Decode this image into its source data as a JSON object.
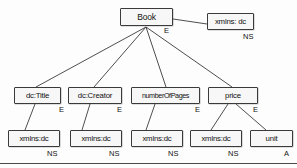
{
  "diagram": {
    "type": "node-tree",
    "stroke_color": "#3a3a3a",
    "node_fill": "#f7f7f7",
    "text_color": "#111111",
    "background": "#fdfdfd",
    "nodes": [
      {
        "id": "book",
        "label": "Book",
        "x": 120,
        "y": 8,
        "w": 53,
        "h": 18,
        "size": "normal"
      },
      {
        "id": "xmlns_top",
        "label": "xmlns: dc",
        "x": 207,
        "y": 13,
        "w": 47,
        "h": 17,
        "size": "small"
      },
      {
        "id": "dctitle",
        "label": "dc:Title",
        "x": 14,
        "y": 87,
        "w": 47,
        "h": 17,
        "size": "small"
      },
      {
        "id": "dccreator",
        "label": "dc:Creator",
        "x": 68,
        "y": 87,
        "w": 54,
        "h": 17,
        "size": "small"
      },
      {
        "id": "numpages",
        "label": "numberOfPages",
        "x": 131,
        "y": 87,
        "w": 69,
        "h": 17,
        "size": "tight"
      },
      {
        "id": "price",
        "label": "price",
        "x": 208,
        "y": 87,
        "w": 50,
        "h": 17,
        "size": "small"
      },
      {
        "id": "xmlns_1",
        "label": "xmlns:dc",
        "x": 8,
        "y": 130,
        "w": 52,
        "h": 17,
        "size": "small"
      },
      {
        "id": "xmlns_2",
        "label": "xmlns:dc",
        "x": 70,
        "y": 130,
        "w": 52,
        "h": 17,
        "size": "small"
      },
      {
        "id": "xmlns_3",
        "label": "xmlns:dc",
        "x": 131,
        "y": 130,
        "w": 52,
        "h": 17,
        "size": "small"
      },
      {
        "id": "xmlns_4",
        "label": "xmlns:dc",
        "x": 190,
        "y": 130,
        "w": 52,
        "h": 17,
        "size": "small"
      },
      {
        "id": "unit",
        "label": "unit",
        "x": 250,
        "y": 130,
        "w": 43,
        "h": 17,
        "size": "small"
      }
    ],
    "edges": [
      {
        "id": "book-xmlns",
        "x1": 173,
        "y1": 19,
        "x2": 207,
        "y2": 24
      },
      {
        "id": "book-dctitle",
        "x1": 146,
        "y1": 27,
        "x2": 36,
        "y2": 87
      },
      {
        "id": "book-dccreator",
        "x1": 146,
        "y1": 27,
        "x2": 94,
        "y2": 87
      },
      {
        "id": "book-numpages",
        "x1": 146,
        "y1": 27,
        "x2": 166,
        "y2": 87
      },
      {
        "id": "book-price",
        "x1": 146,
        "y1": 27,
        "x2": 232,
        "y2": 87
      },
      {
        "id": "dctitle-xmlns1",
        "x1": 35,
        "y1": 104,
        "x2": 25,
        "y2": 130
      },
      {
        "id": "dccreator-xmlns2",
        "x1": 90,
        "y1": 104,
        "x2": 82,
        "y2": 130
      },
      {
        "id": "numpages-xmlns3",
        "x1": 155,
        "y1": 104,
        "x2": 146,
        "y2": 130
      },
      {
        "id": "price-xmlns4",
        "x1": 228,
        "y1": 104,
        "x2": 211,
        "y2": 130
      },
      {
        "id": "price-unit",
        "x1": 236,
        "y1": 104,
        "x2": 266,
        "y2": 130
      }
    ],
    "edge_labels": [
      {
        "id": "label-book-e",
        "text": "E",
        "x": 164,
        "y": 27
      },
      {
        "id": "label-xmlns-top-ns",
        "text": "NS",
        "x": 243,
        "y": 33
      },
      {
        "id": "label-dctitle-e",
        "text": "E",
        "x": 59,
        "y": 106
      },
      {
        "id": "label-dccreator-e",
        "text": "E",
        "x": 117,
        "y": 106
      },
      {
        "id": "label-numpages-e",
        "text": "E",
        "x": 195,
        "y": 106
      },
      {
        "id": "label-price-e",
        "text": "E",
        "x": 253,
        "y": 106
      },
      {
        "id": "label-xmlns1-ns",
        "text": "NS",
        "x": 47,
        "y": 150
      },
      {
        "id": "label-xmlns2-ns",
        "text": "NS",
        "x": 109,
        "y": 150
      },
      {
        "id": "label-xmlns3-ns",
        "text": "NS",
        "x": 168,
        "y": 150
      },
      {
        "id": "label-xmlns4-ns",
        "text": "NS",
        "x": 228,
        "y": 150
      },
      {
        "id": "label-unit-a",
        "text": "A",
        "x": 284,
        "y": 150
      }
    ],
    "rules": [
      {
        "id": "bottom-rule",
        "y": 163
      }
    ]
  }
}
